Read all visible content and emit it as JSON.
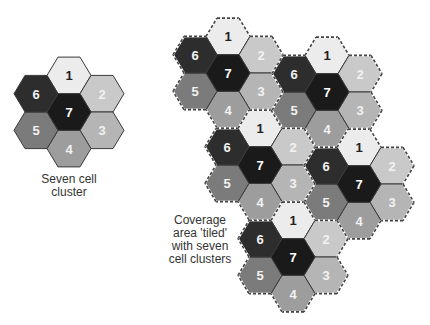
{
  "hex": {
    "radius": 22,
    "row_height": 36.6,
    "col_spacing": 33
  },
  "cell_styles": {
    "1": {
      "fill": "#ececec",
      "text": "#222222"
    },
    "2": {
      "fill": "#c9c9c9",
      "text": "#f2f2f2"
    },
    "3": {
      "fill": "#b5b5b5",
      "text": "#f2f2f2"
    },
    "4": {
      "fill": "#9d9d9d",
      "text": "#f2f2f2"
    },
    "5": {
      "fill": "#7b7b7b",
      "text": "#f2f2f2"
    },
    "6": {
      "fill": "#2d2d2d",
      "text": "#f2f2f2"
    },
    "7": {
      "fill": "#1a1a1a",
      "text": "#ffffff"
    }
  },
  "cell_offsets": {
    "1": [
      0,
      -1
    ],
    "2": [
      1,
      -0.5
    ],
    "3": [
      1,
      0.5
    ],
    "4": [
      0,
      1
    ],
    "5": [
      -1,
      0.5
    ],
    "6": [
      -1,
      -0.5
    ],
    "7": [
      0,
      0
    ]
  },
  "single_cluster": {
    "center": [
      69,
      112
    ],
    "dashed": false,
    "caption": [
      "Seven cell",
      "cluster"
    ]
  },
  "tiled_area": {
    "clusters": [
      {
        "id": "A",
        "center": [
          228,
          73
        ]
      },
      {
        "id": "B",
        "center": [
          327,
          92
        ]
      },
      {
        "id": "C",
        "center": [
          260,
          165
        ]
      },
      {
        "id": "D",
        "center": [
          359,
          184
        ]
      },
      {
        "id": "E",
        "center": [
          293,
          257
        ]
      }
    ],
    "dashed": true,
    "caption": [
      "Coverage",
      "area 'tiled'",
      "with seven",
      "cell clusters"
    ]
  },
  "border_color": "#3a3a3a",
  "dash_color": "#444444"
}
